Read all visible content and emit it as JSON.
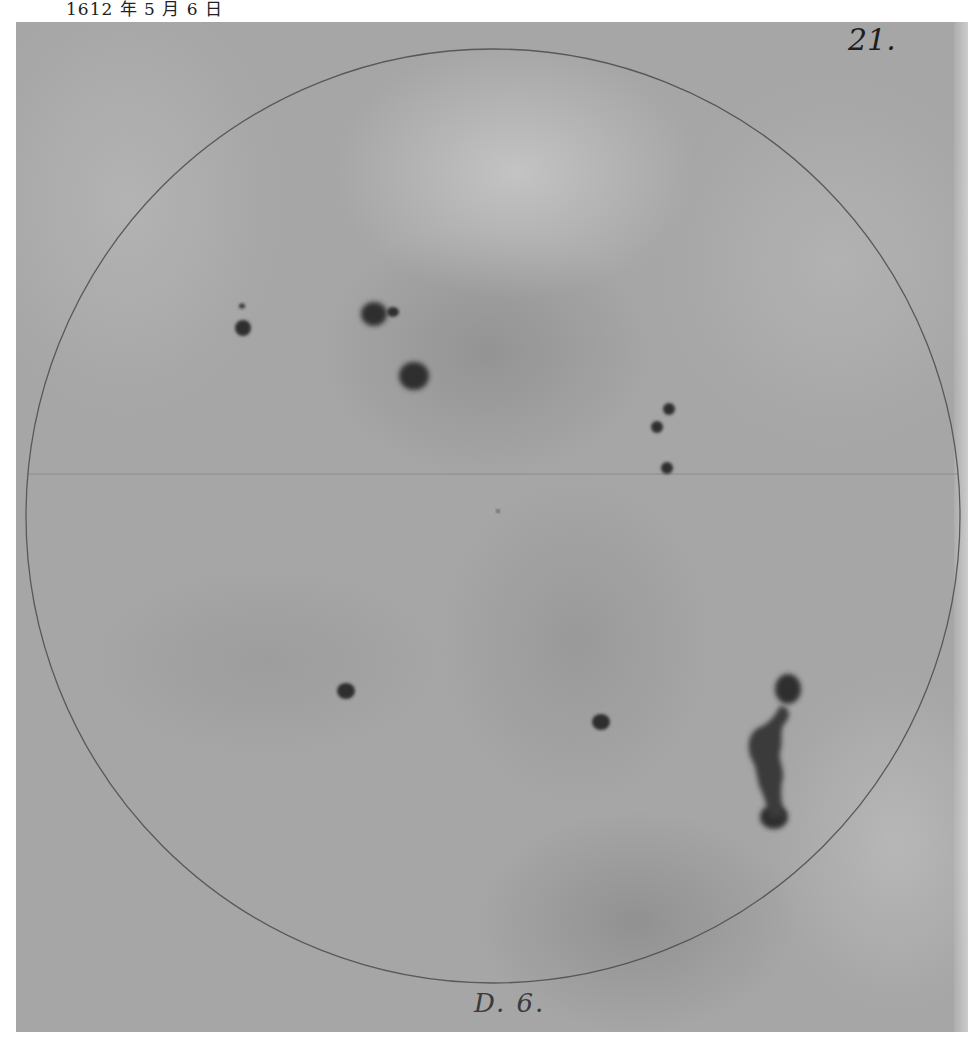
{
  "caption": "1612 年 5 月 6 日",
  "plate": {
    "page_number": "21.",
    "date_note": "D. 6.",
    "colors": {
      "background": "#a6a6a6",
      "ink": "#2a2a2a",
      "circle_line": "#4a4a4a"
    },
    "disk": {
      "cx": 477,
      "cy": 494,
      "r": 467
    },
    "diameter_line_y": 452,
    "sunspots": [
      {
        "id": "spot-small-upper-left",
        "cx": 226,
        "cy": 284,
        "rx": 3,
        "ry": 2.5
      },
      {
        "id": "spot-upper-left",
        "cx": 227,
        "cy": 306,
        "rx": 8,
        "ry": 8
      },
      {
        "id": "spot-upper-center-main",
        "cx": 358,
        "cy": 292,
        "rx": 13,
        "ry": 12
      },
      {
        "id": "spot-upper-center-companion",
        "cx": 377,
        "cy": 290,
        "rx": 6,
        "ry": 5
      },
      {
        "id": "spot-upper-center-lower",
        "cx": 398,
        "cy": 354,
        "rx": 15,
        "ry": 14
      },
      {
        "id": "spot-right-chain-1",
        "cx": 653,
        "cy": 387,
        "rx": 6,
        "ry": 6
      },
      {
        "id": "spot-right-chain-2",
        "cx": 641,
        "cy": 405,
        "rx": 6,
        "ry": 6
      },
      {
        "id": "spot-right-chain-3",
        "cx": 651,
        "cy": 446,
        "rx": 6,
        "ry": 6
      },
      {
        "id": "spot-center-dot",
        "cx": 482,
        "cy": 489,
        "rx": 1.5,
        "ry": 1.5
      },
      {
        "id": "spot-lower-left",
        "cx": 330,
        "cy": 669,
        "rx": 9,
        "ry": 8
      },
      {
        "id": "spot-lower-center",
        "cx": 585,
        "cy": 700,
        "rx": 9,
        "ry": 8
      },
      {
        "id": "spot-group-lower-right-top",
        "cx": 772,
        "cy": 667,
        "rx": 13,
        "ry": 15
      },
      {
        "id": "spot-group-lower-right-bottom",
        "cx": 758,
        "cy": 795,
        "rx": 14,
        "ry": 12
      }
    ]
  }
}
